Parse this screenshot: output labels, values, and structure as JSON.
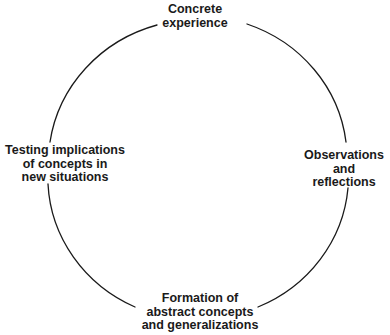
{
  "diagram": {
    "type": "cycle",
    "stroke_color": "#1a1a1a",
    "background": "#ffffff",
    "nodes": [
      {
        "id": "top",
        "position": "top",
        "lines": [
          "Concrete",
          "experience"
        ]
      },
      {
        "id": "right",
        "position": "right",
        "lines": [
          "Observations",
          "and",
          "reflections"
        ]
      },
      {
        "id": "bottom",
        "position": "bottom",
        "lines": [
          "Formation of",
          "abstract concepts",
          "and generalizations"
        ]
      },
      {
        "id": "left",
        "position": "left",
        "lines": [
          "Testing implications",
          "of concepts in",
          "new situations"
        ]
      }
    ],
    "edges": [
      {
        "from": "top",
        "to": "right"
      },
      {
        "from": "right",
        "to": "bottom"
      },
      {
        "from": "bottom",
        "to": "left"
      },
      {
        "from": "left",
        "to": "top"
      }
    ]
  }
}
